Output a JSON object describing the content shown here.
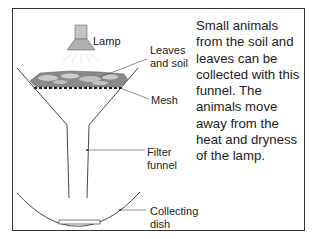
{
  "diagram": {
    "type": "labeled-apparatus",
    "labels": {
      "lamp": "Lamp",
      "leaves_line1": "Leaves",
      "leaves_line2": "and soil",
      "mesh": "Mesh",
      "funnel_line1": "Filter",
      "funnel_line2": "funnel",
      "dish_line1": "Collecting",
      "dish_line2": "dish"
    },
    "description": "Small animals from the soil and leaves can be collected with this funnel. The animals move away from the heat and dryness of the lamp.",
    "colors": {
      "line": "#333333",
      "lamp_fill": "#b8b8b8",
      "soil_fill": "#8a8a8a",
      "leaf_fill": "#c8c8c8"
    }
  }
}
